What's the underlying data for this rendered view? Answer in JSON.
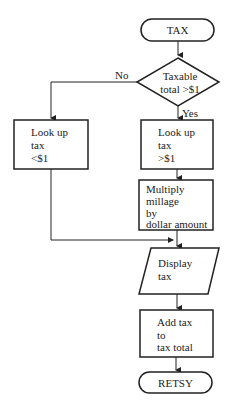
{
  "flowchart": {
    "start": {
      "label": "TAX"
    },
    "decision": {
      "line1": "Taxable",
      "line2": "total >$1",
      "no_label": "No",
      "yes_label": "Yes"
    },
    "lookup_low": {
      "lines": [
        "Look up",
        "tax",
        "<$1"
      ]
    },
    "lookup_high": {
      "lines": [
        "Look up",
        "tax",
        ">$1"
      ]
    },
    "multiply": {
      "lines": [
        "Multiply",
        "millage",
        "by",
        "dollar amount"
      ]
    },
    "display": {
      "lines": [
        "Display",
        "tax"
      ]
    },
    "add": {
      "lines": [
        "Add tax",
        "to",
        "tax total"
      ]
    },
    "end": {
      "label": "RETSY"
    }
  },
  "colors": {
    "stroke": "#222222",
    "background": "#ffffff"
  }
}
